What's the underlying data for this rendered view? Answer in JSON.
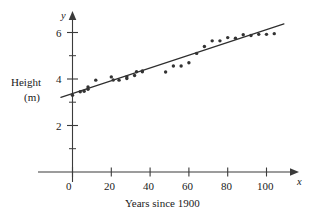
{
  "chart_data": {
    "type": "scatter",
    "title": "",
    "xlabel": "Years since 1900",
    "ylabel_line1": "Height",
    "ylabel_line2": "(m)",
    "x_axis_symbol": "x",
    "y_axis_symbol": "y",
    "xlim": [
      -8,
      112
    ],
    "ylim": [
      0,
      6.9
    ],
    "xticks": [
      0,
      20,
      40,
      60,
      80,
      100
    ],
    "xtick_labels": [
      "0",
      "20",
      "40",
      "60",
      "80",
      "100"
    ],
    "x_minor_ticks": [
      10,
      30,
      50,
      70,
      90
    ],
    "yticks": [
      2,
      4,
      6
    ],
    "ytick_labels": [
      "2",
      "4",
      "6"
    ],
    "y_minor_ticks": [
      1,
      3,
      5
    ],
    "grid": false,
    "legend": false,
    "point_color": "#333333",
    "line_color": "#2e2e2e",
    "axis_color": "#3b3b3b",
    "points": [
      [
        0,
        3.3
      ],
      [
        4,
        3.45
      ],
      [
        6,
        3.47
      ],
      [
        8,
        3.56
      ],
      [
        8,
        3.66
      ],
      [
        12,
        3.95
      ],
      [
        20,
        4.09
      ],
      [
        21,
        3.96
      ],
      [
        24,
        3.95
      ],
      [
        28,
        4.02
      ],
      [
        28,
        4.1
      ],
      [
        32,
        4.15
      ],
      [
        33,
        4.31
      ],
      [
        36,
        4.31
      ],
      [
        36,
        4.35
      ],
      [
        48,
        4.3
      ],
      [
        52,
        4.56
      ],
      [
        56,
        4.56
      ],
      [
        60,
        4.7
      ],
      [
        64,
        5.1
      ],
      [
        68,
        5.4
      ],
      [
        72,
        5.64
      ],
      [
        76,
        5.64
      ],
      [
        80,
        5.78
      ],
      [
        84,
        5.75
      ],
      [
        88,
        5.9
      ],
      [
        92,
        5.87
      ],
      [
        96,
        5.92
      ],
      [
        100,
        5.92
      ],
      [
        104,
        5.95
      ]
    ],
    "trend_line": {
      "x_start": -6,
      "y_start": 3.21,
      "x_end": 109,
      "y_end": 6.37
    }
  }
}
